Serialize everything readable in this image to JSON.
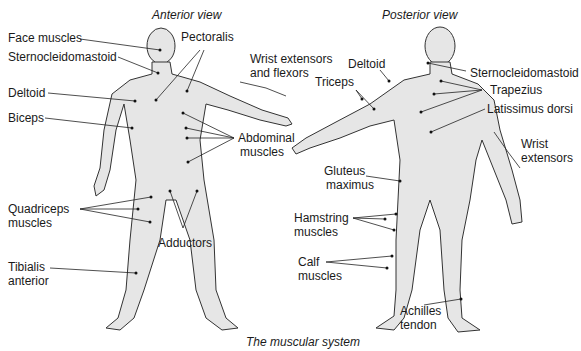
{
  "diagram": {
    "caption": "The muscular system",
    "anterior": {
      "title": "Anterior view",
      "labels": {
        "face": "Face muscles",
        "scm": "Sternocleidomastoid",
        "pectoralis": "Pectoralis",
        "wrist1": "Wrist extensors",
        "wrist2": "and flexors",
        "deltoid": "Deltoid",
        "biceps": "Biceps",
        "abd1": "Abdominal",
        "abd2": "muscles",
        "quad1": "Quadriceps",
        "quad2": "muscles",
        "adductors": "Adductors",
        "tib1": "Tibialis",
        "tib2": "anterior"
      }
    },
    "posterior": {
      "title": "Posterior view",
      "labels": {
        "deltoid": "Deltoid",
        "triceps": "Triceps",
        "scm": "Sternocleidomastoid",
        "trapezius": "Trapezius",
        "latissimus": "Latissimus dorsi",
        "wrist1": "Wrist",
        "wrist2": "extensors",
        "glut1": "Gluteus",
        "glut2": "maximus",
        "ham1": "Hamstring",
        "ham2": "muscles",
        "calf1": "Calf",
        "calf2": "muscles",
        "ach1": "Achilles",
        "ach2": "tendon"
      }
    }
  }
}
